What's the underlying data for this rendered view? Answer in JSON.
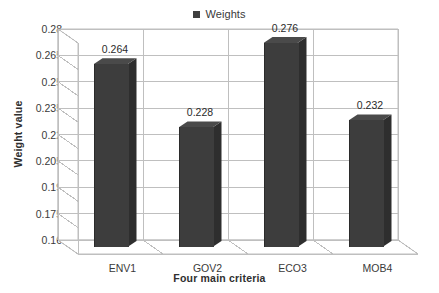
{
  "chart_data": {
    "type": "bar",
    "title": "",
    "subtitle": "",
    "xlabel": "Four main criteria",
    "ylabel": "Weight value",
    "categories": [
      "ENV1",
      "GOV2",
      "ECO3",
      "MOB4"
    ],
    "values": [
      0.264,
      0.228,
      0.276,
      0.232
    ],
    "data_labels": [
      "0.264",
      "0.228",
      "0.276",
      "0.232"
    ],
    "series": [
      {
        "name": "Weights",
        "values": [
          0.264,
          0.228,
          0.276,
          0.232
        ]
      }
    ],
    "ylim": [
      0.16,
      0.28
    ],
    "ytick_labels": [
      "0.28",
      "0.265",
      "0.25",
      "0.235",
      "0.22",
      "0.205",
      "0.19",
      "0.175",
      "0.16"
    ],
    "ytick_values": [
      0.28,
      0.265,
      0.25,
      0.235,
      0.22,
      0.205,
      0.19,
      0.175,
      0.16
    ],
    "grid": true,
    "grid_axis": "y",
    "legend": {
      "position": "top-center",
      "entries": [
        "Weights"
      ]
    },
    "style": "3d-column",
    "bar_color": "#3d3d3d",
    "bar_side_color": "#2e2e2e",
    "bar_top_color": "#4a4a4a",
    "grid_color": "#bfbfbf",
    "text_color": "#3a3a3a",
    "background": "#ffffff"
  },
  "legend": {
    "label": "Weights",
    "swatch_color": "#3f3f3f"
  },
  "axes": {
    "y_title": "Weight value",
    "x_title": "Four main criteria"
  }
}
